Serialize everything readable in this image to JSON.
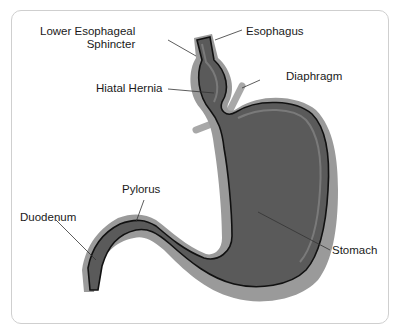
{
  "diagram": {
    "colors": {
      "organ_fill": "#5a5a5a",
      "outer_wall": "#9a9a9a",
      "mucosa_line": "#111111",
      "diaphragm": "#a8a8a8",
      "frame_border": "#cfcfcf",
      "leader_line": "#333333"
    },
    "labels": {
      "les_line1": "Lower Esophageal",
      "les_line2": "Sphincter",
      "esophagus": "Esophagus",
      "hiatal_hernia": "Hiatal Hernia",
      "diaphragm": "Diaphragm",
      "pylorus": "Pylorus",
      "duodenum": "Duodenum",
      "stomach": "Stomach"
    }
  }
}
